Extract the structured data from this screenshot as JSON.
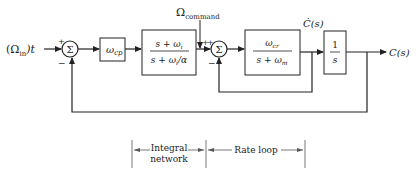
{
  "diagram": {
    "type": "block-diagram",
    "input": {
      "label": "(Ω",
      "sub": "in",
      "suffix": ")t"
    },
    "command": {
      "label": "Ω",
      "sub": "command"
    },
    "output": {
      "label": "C(s)"
    },
    "rate_signal": {
      "label": "Ċ(s)"
    },
    "summers": [
      {
        "id": "sum1",
        "symbol": "Σ",
        "plus": "+",
        "minus": "−"
      },
      {
        "id": "sum2",
        "symbol": "Σ",
        "plus": "+",
        "plus2": "+",
        "minus": "−"
      }
    ],
    "blocks": [
      {
        "id": "gain",
        "tf_main": "ω",
        "tf_sub": "cp"
      },
      {
        "id": "integral",
        "num": "s + ω",
        "num_sub": "i",
        "den": "s + ω",
        "den_sub": "i",
        "den_suffix": "/α"
      },
      {
        "id": "rate",
        "num": "ω",
        "num_sub": "cr",
        "den": "s + ω",
        "den_sub": "m"
      },
      {
        "id": "integrator",
        "num": "1",
        "den": "s"
      }
    ],
    "brackets": [
      {
        "id": "integral-network",
        "line1": "Integral",
        "line2": "network"
      },
      {
        "id": "rate-loop",
        "line1": "Rate loop"
      }
    ]
  },
  "colors": {
    "stroke": "#222222",
    "background": "#ffffff"
  }
}
